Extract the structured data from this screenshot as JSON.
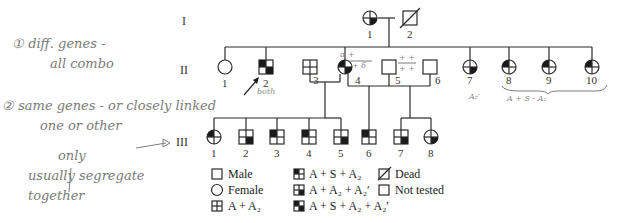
{
  "generations": [
    "I",
    "II",
    "III"
  ],
  "gen_I": [
    {
      "id": "1",
      "sex": "female",
      "phenotype": "A + A2 + A2'"
    },
    {
      "id": "2",
      "sex": "male",
      "phenotype": "Dead"
    }
  ],
  "gen_II": [
    {
      "id": "1",
      "sex": "female",
      "phenotype": "Not tested"
    },
    {
      "id": "2",
      "sex": "male",
      "phenotype": "A + S + A2 + A2'",
      "proband": true
    },
    {
      "id": "3",
      "sex": "male",
      "phenotype": "A + A2"
    },
    {
      "id": "4",
      "sex": "female",
      "phenotype": "A + S + A2 + A2'"
    },
    {
      "id": "5",
      "sex": "male",
      "phenotype": "Not tested"
    },
    {
      "id": "6",
      "sex": "male",
      "phenotype": "Not tested"
    },
    {
      "id": "7",
      "sex": "female",
      "phenotype": "A + A2 + A2'"
    },
    {
      "id": "8",
      "sex": "female",
      "phenotype": "A + S + A2"
    },
    {
      "id": "9",
      "sex": "female",
      "phenotype": "A + S + A2"
    },
    {
      "id": "10",
      "sex": "female",
      "phenotype": "A + S + A2"
    }
  ],
  "gen_III": [
    {
      "id": "1",
      "sex": "female",
      "phenotype": "A + S + A2"
    },
    {
      "id": "2",
      "sex": "male",
      "phenotype": "A + A2 + A2'"
    },
    {
      "id": "3",
      "sex": "male",
      "phenotype": "A + S + A2"
    },
    {
      "id": "4",
      "sex": "male",
      "phenotype": "A + S + A2"
    },
    {
      "id": "5",
      "sex": "male",
      "phenotype": "A + A2 + A2'"
    },
    {
      "id": "6",
      "sex": "male",
      "phenotype": "A + S + A2"
    },
    {
      "id": "7",
      "sex": "male",
      "phenotype": "A + A2 + A2'"
    },
    {
      "id": "8",
      "sex": "female",
      "phenotype": "A + A2 + A2'"
    }
  ],
  "legend": {
    "male": "Male",
    "female": "Female",
    "a_a2": "A + A₂",
    "a_s_a2": "A + S + A₂",
    "a_a2_a2p": "A + A₂ + A₂′",
    "a_s_a2_a2p": "A + S + A₂ + A₂′",
    "dead": "Dead",
    "not_tested": "Not tested"
  },
  "annotations": {
    "note1_line1": "① diff. genes -",
    "note1_line2": "all combo",
    "note2_line1": "② same genes - or closely linked",
    "note2_line2": "one or other",
    "note2_line3": "only",
    "note2_line4": "usually segregate",
    "note2_line5": "together",
    "proband_note": "both",
    "ii4_top": "α +",
    "ii4_bot": "+ δ",
    "ii5_top": "+ +",
    "ii5_bot": "+ +",
    "ii7_note": "A₂′",
    "ii8_10_note": "A + S - A₂"
  }
}
